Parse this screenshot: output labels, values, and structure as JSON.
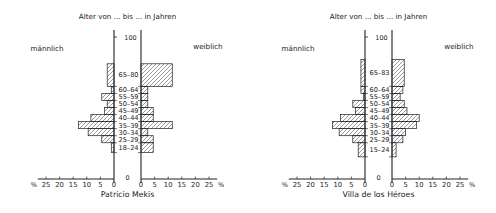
{
  "chart_data": [
    {
      "type": "bar",
      "subtype": "population-pyramid",
      "title": "Patricio Mekis",
      "header": "Alter von ... bis ... in Jahren",
      "left_label": "männlich",
      "right_label": "weiblich",
      "xlabel": "%",
      "x_ticks": [
        25,
        20,
        15,
        10,
        5,
        0
      ],
      "x_range": [
        0,
        28
      ],
      "y_ticks": [
        0,
        100
      ],
      "groups": [
        {
          "label": "18–24",
          "from": 18,
          "to": 24,
          "male": 1,
          "female": 4.5
        },
        {
          "label": "25–29",
          "from": 25,
          "to": 29,
          "male": 4.5,
          "female": 4.5
        },
        {
          "label": "30–34",
          "from": 30,
          "to": 34,
          "male": 9.5,
          "female": 2.5
        },
        {
          "label": "35–39",
          "from": 35,
          "to": 39,
          "male": 13,
          "female": 11.5
        },
        {
          "label": "40–44",
          "from": 40,
          "to": 44,
          "male": 8.5,
          "female": 4.5
        },
        {
          "label": "45–49",
          "from": 45,
          "to": 49,
          "male": 3.5,
          "female": 4.5
        },
        {
          "label": "50–54",
          "from": 50,
          "to": 54,
          "male": 2.5,
          "female": 2.5
        },
        {
          "label": "55–59",
          "from": 55,
          "to": 59,
          "male": 4.5,
          "female": 2.5
        },
        {
          "label": "60–64",
          "from": 60,
          "to": 64,
          "male": 1,
          "female": 2.5
        },
        {
          "label": "65–80",
          "from": 65,
          "to": 80,
          "male": 2.5,
          "female": 11.5
        }
      ]
    },
    {
      "type": "bar",
      "subtype": "population-pyramid",
      "title": "Villa de los Héroes",
      "header": "Alter von ... bis ... in Jahren",
      "left_label": "männlich",
      "right_label": "weiblich",
      "xlabel": "%",
      "x_ticks": [
        25,
        20,
        15,
        10,
        5,
        0
      ],
      "x_range": [
        0,
        28
      ],
      "y_ticks": [
        0,
        100
      ],
      "groups": [
        {
          "label": "15–24",
          "from": 15,
          "to": 24,
          "male": 2.5,
          "female": 1.5
        },
        {
          "label": "25–29",
          "from": 25,
          "to": 29,
          "male": 4.5,
          "female": 4
        },
        {
          "label": "30–34",
          "from": 30,
          "to": 34,
          "male": 9.5,
          "female": 5
        },
        {
          "label": "35–39",
          "from": 35,
          "to": 39,
          "male": 12,
          "female": 9
        },
        {
          "label": "40–44",
          "from": 40,
          "to": 44,
          "male": 9,
          "female": 10
        },
        {
          "label": "45–49",
          "from": 45,
          "to": 49,
          "male": 3.5,
          "female": 5.5
        },
        {
          "label": "50–54",
          "from": 50,
          "to": 54,
          "male": 4.5,
          "female": 4.5
        },
        {
          "label": "55–59",
          "from": 55,
          "to": 59,
          "male": 0.5,
          "female": 3
        },
        {
          "label": "60–64",
          "from": 60,
          "to": 64,
          "male": 1.5,
          "female": 4
        },
        {
          "label": "65–83",
          "from": 65,
          "to": 83,
          "male": 1.5,
          "female": 4.5
        }
      ]
    }
  ],
  "colors": {
    "ink": "#222222",
    "hatch": "#555555",
    "background": "#ffffff"
  }
}
